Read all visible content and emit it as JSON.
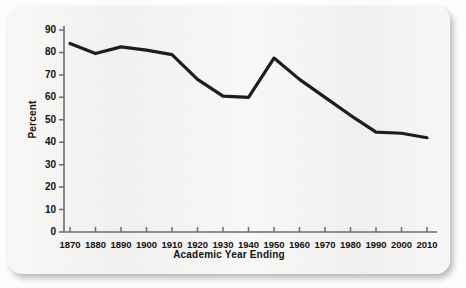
{
  "chart_data": {
    "type": "line",
    "title": "",
    "xlabel": "Academic Year Ending",
    "ylabel": "Percent",
    "categories": [
      "1870",
      "1880",
      "1890",
      "1900",
      "1910",
      "1920",
      "1930",
      "1940",
      "1950",
      "1960",
      "1970",
      "1980",
      "1990",
      "2000",
      "2010"
    ],
    "values": [
      84,
      79.5,
      82.5,
      81,
      79,
      68,
      60.5,
      60,
      77.5,
      68,
      60,
      52,
      44.5,
      44,
      42
    ],
    "x": [
      1870,
      1880,
      1890,
      1900,
      1910,
      1920,
      1930,
      1940,
      1950,
      1960,
      1970,
      1980,
      1990,
      2000,
      2010
    ],
    "yticks": [
      0,
      10,
      20,
      30,
      40,
      50,
      60,
      70,
      80,
      90
    ],
    "ylim": [
      0,
      90
    ],
    "xlim": [
      1870,
      2010
    ],
    "grid": false,
    "legend": false,
    "series": [
      {
        "name": "Percent",
        "color": "#1d1d1d",
        "values": [
          84,
          79.5,
          82.5,
          81,
          79,
          68,
          60.5,
          60,
          77.5,
          68,
          60,
          52,
          44.5,
          44,
          42
        ]
      }
    ],
    "line_color": "#1d1d1d",
    "axis_color": "#6d6d6d",
    "background": "#f2f1ef"
  }
}
